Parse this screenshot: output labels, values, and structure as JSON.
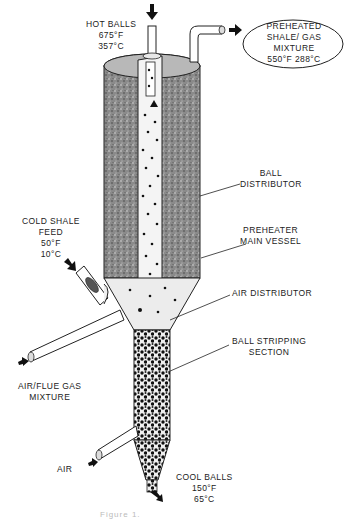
{
  "diagram": {
    "type": "process-equipment-schematic"
  },
  "labels": {
    "hot_balls": {
      "title": "HOT BALLS",
      "temp_f": "675°F",
      "temp_c": "357°C"
    },
    "preheated_output": {
      "line1": "PREHEATED",
      "line2": "SHALE/  GAS",
      "line3": "MIXTURE",
      "temps": "550°F 288°C"
    },
    "ball_distributor": {
      "line1": "BALL",
      "line2": "DISTRIBUTOR"
    },
    "preheater_main_vessel": {
      "line1": "PREHEATER",
      "line2": "MAIN  VESSEL"
    },
    "cold_shale_feed": {
      "line1": "COLD SHALE",
      "line2": "FEED",
      "temp_f": "50°F",
      "temp_c": "10°C"
    },
    "air_distributor": {
      "line1": "AIR  DISTRIBUTOR"
    },
    "ball_stripping_section": {
      "line1": "BALL  STRIPPING",
      "line2": "SECTION"
    },
    "air_flue_gas": {
      "line1": "AIR/FLUE  GAS",
      "line2": "MIXTURE"
    },
    "air": {
      "line1": "AIR"
    },
    "cool_balls": {
      "title": "COOL  BALLS",
      "temp_f": "150°F",
      "temp_c": "65°C"
    }
  },
  "caption": "Figure 1."
}
